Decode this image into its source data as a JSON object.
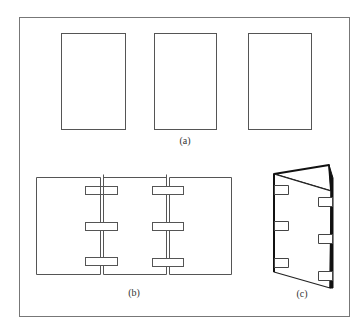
{
  "figure": {
    "panels": [
      {
        "id": "a",
        "label": "(a)",
        "description": "three separate rectangular sheets"
      },
      {
        "id": "b",
        "label": "(b)",
        "description": "three sheets joined edge-to-edge with tabs across each seam"
      },
      {
        "id": "c",
        "label": "(c)",
        "description": "sheets folded into a triangular standing form"
      }
    ],
    "colors": {
      "stroke": "#555555",
      "frame": "#777777",
      "background": "#ffffff",
      "dark": "#111111"
    }
  }
}
